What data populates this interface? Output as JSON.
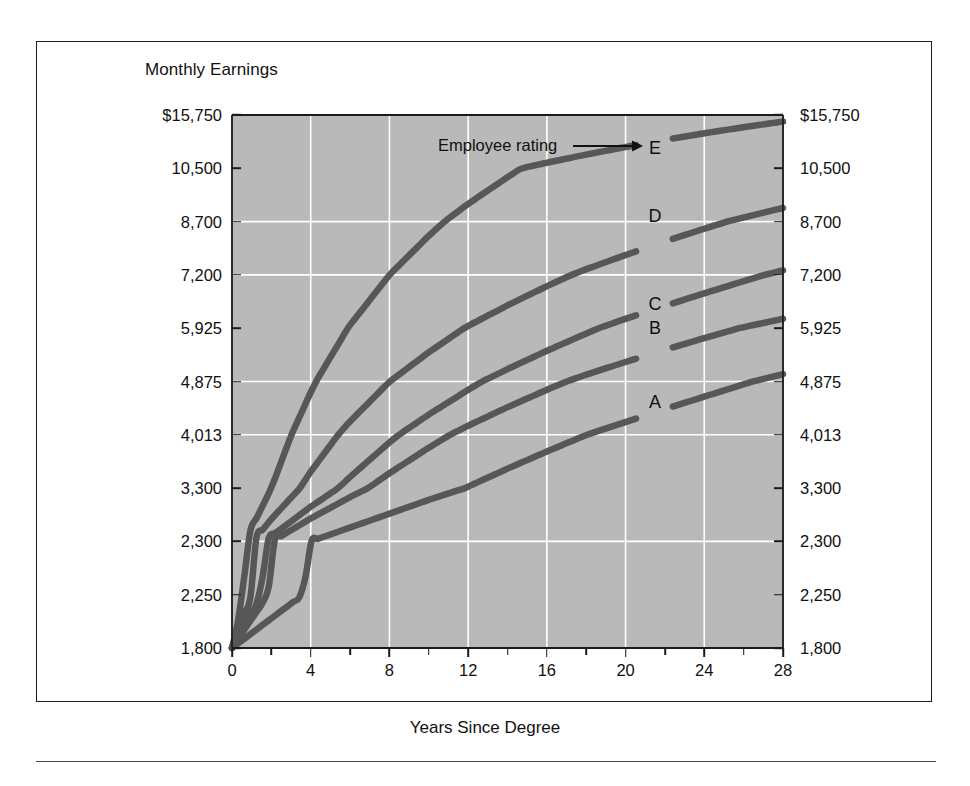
{
  "figure": {
    "title": "Monthly Earnings",
    "xaxis_title": "Years Since Degree",
    "annotation": "Employee rating"
  },
  "axes": {
    "y_left_labels": [
      "$15,750",
      "10,500",
      "8,700",
      "7,200",
      "5,925",
      "4,875",
      "4,013",
      "3,300",
      "2,300",
      "2,250",
      "1,800"
    ],
    "y_right_labels": [
      "$15,750",
      "10,500",
      "8,700",
      "7,200",
      "5,925",
      "4,875",
      "4,013",
      "3,300",
      "2,300",
      "2,250",
      "1,800"
    ],
    "x_labels": [
      "0",
      "4",
      "8",
      "12",
      "16",
      "20",
      "24",
      "28"
    ]
  },
  "curve_labels": [
    "A",
    "B",
    "C",
    "D",
    "E"
  ],
  "colors": {
    "plot_background": "#b9b9b9",
    "gridline": "#ffffff",
    "curve": "#575757",
    "axis": "#1b1b1b",
    "page_background": "#ffffff"
  },
  "chart_data": {
    "type": "line",
    "title": "Monthly Earnings",
    "xlabel": "Years Since Degree",
    "ylabel": "Monthly Earnings",
    "xlim": [
      0,
      28
    ],
    "ylim": [
      1800,
      15750
    ],
    "yscale": "custom-ordinal (equally spaced tick values)",
    "grid": true,
    "legend": "inline curve end labels A-E",
    "annotations": [
      {
        "text": "Employee rating",
        "points_to": "E",
        "x": 21.5,
        "y": 12800
      }
    ],
    "x_ticks": [
      0,
      4,
      8,
      12,
      16,
      20,
      24,
      28
    ],
    "x_minor_tick_interval": 2,
    "y_ticks": [
      1800,
      2250,
      2300,
      3300,
      4013,
      4875,
      5925,
      7200,
      8700,
      10500,
      15750
    ],
    "y_tick_labels": [
      "1,800",
      "2,250",
      "2,300",
      "3,300",
      "4,013",
      "4,875",
      "5,925",
      "7,200",
      "8,700",
      "10,500",
      "$15,750"
    ],
    "series": [
      {
        "name": "A",
        "label_position": {
          "x": 21.5,
          "y": 4550
        },
        "x": [
          0,
          2,
          4,
          6,
          8,
          10,
          12,
          14,
          16,
          18,
          20,
          22,
          24,
          26,
          28
        ],
        "y": [
          1800,
          2050,
          2300,
          2560,
          2820,
          3080,
          3320,
          3560,
          3790,
          4010,
          4220,
          4430,
          4630,
          4830,
          5020
        ]
      },
      {
        "name": "B",
        "label_position": {
          "x": 21.5,
          "y": 5925
        },
        "x": [
          0,
          2,
          4,
          6,
          8,
          10,
          12,
          14,
          16,
          18,
          20,
          22,
          24,
          26,
          28
        ],
        "y": [
          1800,
          2290,
          2730,
          3130,
          3500,
          3840,
          4160,
          4460,
          4740,
          5010,
          5260,
          5500,
          5730,
          5950,
          6150
        ]
      },
      {
        "name": "C",
        "label_position": {
          "x": 21.5,
          "y": 6500
        },
        "x": [
          0,
          2,
          4,
          6,
          8,
          10,
          12,
          14,
          16,
          18,
          20,
          22,
          24,
          26,
          28
        ],
        "y": [
          1800,
          2400,
          2950,
          3450,
          3910,
          4340,
          4740,
          5120,
          5480,
          5820,
          6150,
          6460,
          6760,
          7050,
          7330
        ]
      },
      {
        "name": "D",
        "label_position": {
          "x": 21.5,
          "y": 8900
        },
        "x": [
          0,
          2,
          4,
          6,
          8,
          10,
          12,
          14,
          16,
          18,
          20,
          22,
          24,
          26,
          28
        ],
        "y": [
          1800,
          2720,
          3520,
          4230,
          4870,
          5450,
          5980,
          6470,
          6930,
          7360,
          7760,
          8140,
          8500,
          8840,
          9160
        ]
      },
      {
        "name": "E",
        "label_position": {
          "x": 21.5,
          "y": 12500
        },
        "x": [
          0,
          2,
          4,
          6,
          8,
          10,
          12,
          14,
          16,
          18,
          20,
          22,
          24,
          26,
          28
        ],
        "y": [
          1800,
          3300,
          4700,
          6000,
          7200,
          8300,
          9300,
          10200,
          11050,
          11850,
          12600,
          13300,
          13950,
          14550,
          15100
        ]
      }
    ]
  }
}
